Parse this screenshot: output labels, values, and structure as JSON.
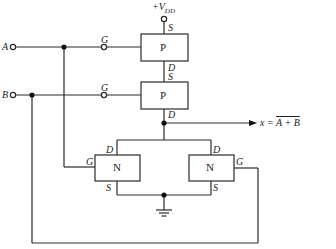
{
  "diagram": {
    "supply": {
      "label": "+V",
      "sub": "DD"
    },
    "inputs": [
      {
        "name": "A",
        "label": "A"
      },
      {
        "name": "B",
        "label": "B"
      }
    ],
    "pmos": [
      {
        "label": "P",
        "gate": "G",
        "source": "S",
        "drain": "D"
      },
      {
        "label": "P",
        "gate": "G",
        "source": "S",
        "drain": "D"
      }
    ],
    "nmos": [
      {
        "label": "N",
        "gate": "G",
        "source": "S",
        "drain": "D"
      },
      {
        "label": "N",
        "gate": "G",
        "source": "S",
        "drain": "D"
      }
    ],
    "output": {
      "prefix": "x = ",
      "expr": "A + B"
    },
    "ground": "ground"
  }
}
